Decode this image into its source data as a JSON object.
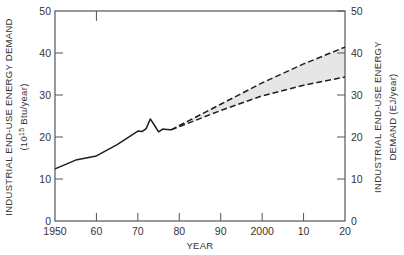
{
  "chart_data": {
    "type": "line",
    "title": "",
    "xlabel": "YEAR",
    "ylabel": "INDUSTRIAL END-USE ENERGY DEMAND",
    "ylabel_units": "(10^15 Btu/year)",
    "ylabel_units_parts": {
      "open": "(10",
      "sup": "15",
      "rest": " Btu/year)"
    },
    "y2label": "INDUSTRIAL END-USE ENERGY",
    "y2label_line2": "DEMAND (EJ/year)",
    "xlim": [
      1950,
      2020
    ],
    "ylim": [
      0,
      50
    ],
    "y2lim": [
      0,
      50
    ],
    "x_ticks": [
      1950,
      1960,
      1970,
      1980,
      1990,
      2000,
      2010,
      2020
    ],
    "x_tick_labels": [
      "1950",
      "60",
      "70",
      "80",
      "90",
      "2000",
      "10",
      "20"
    ],
    "y_ticks": [
      0,
      10,
      20,
      30,
      40,
      50
    ],
    "y_tick_labels": [
      "0",
      "10",
      "20",
      "30",
      "40",
      "50"
    ],
    "y2_ticks": [
      0,
      10,
      20,
      30,
      40,
      50
    ],
    "y2_tick_labels": [
      "0",
      "10",
      "20",
      "30",
      "40",
      "50"
    ],
    "grid": false,
    "legend": null,
    "series": [
      {
        "name": "Historical",
        "style": "solid",
        "x": [
          1950,
          1955,
          1960,
          1965,
          1970,
          1971,
          1972,
          1973,
          1974,
          1975,
          1976,
          1977,
          1978
        ],
        "y": [
          12.4,
          14.5,
          15.5,
          18.2,
          21.4,
          21.3,
          22.0,
          24.3,
          22.8,
          21.2,
          21.9,
          21.8,
          21.7
        ]
      },
      {
        "name": "Projection (high)",
        "style": "dashed",
        "x": [
          1978,
          1990,
          2000,
          2010,
          2020
        ],
        "y": [
          21.7,
          27.8,
          32.9,
          37.4,
          41.4
        ]
      },
      {
        "name": "Projection (low)",
        "style": "dashed",
        "x": [
          1978,
          1990,
          2000,
          2010,
          2020
        ],
        "y": [
          21.7,
          26.3,
          29.8,
          32.3,
          34.3
        ]
      }
    ],
    "shaded_band": {
      "between": [
        "Projection (low)",
        "Projection (high)"
      ],
      "color": "#e6e6e6"
    }
  },
  "colors": {
    "line": "#1e1e1e",
    "axis": "#555555",
    "band": "#e6e6e6"
  }
}
